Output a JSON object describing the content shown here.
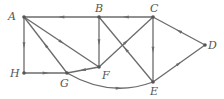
{
  "graph": {
    "type": "directed",
    "nodes": [
      {
        "id": "A",
        "label": "A",
        "x": 24,
        "y": 17,
        "lx": 8,
        "ly": 11
      },
      {
        "id": "B",
        "label": "B",
        "x": 99,
        "y": 17,
        "lx": 95,
        "ly": 3
      },
      {
        "id": "C",
        "label": "C",
        "x": 153,
        "y": 17,
        "lx": 150,
        "ly": 3
      },
      {
        "id": "D",
        "label": "D",
        "x": 205,
        "y": 45,
        "lx": 208,
        "ly": 40
      },
      {
        "id": "E",
        "label": "E",
        "x": 153,
        "y": 82,
        "lx": 150,
        "ly": 86
      },
      {
        "id": "F",
        "label": "F",
        "x": 99,
        "y": 67,
        "lx": 101,
        "ly": 70
      },
      {
        "id": "G",
        "label": "G",
        "x": 67,
        "y": 73,
        "lx": 60,
        "ly": 78
      },
      {
        "id": "H",
        "label": "H",
        "x": 24,
        "y": 73,
        "lx": 10,
        "ly": 68
      }
    ],
    "edges": [
      {
        "from": "B",
        "to": "A"
      },
      {
        "from": "C",
        "to": "B"
      },
      {
        "from": "A",
        "to": "H"
      },
      {
        "from": "H",
        "to": "G"
      },
      {
        "from": "A",
        "to": "F"
      },
      {
        "from": "G",
        "to": "A"
      },
      {
        "from": "B",
        "to": "F"
      },
      {
        "from": "F",
        "to": "G"
      },
      {
        "from": "F",
        "to": "C"
      },
      {
        "from": "E",
        "to": "B"
      },
      {
        "from": "C",
        "to": "E"
      },
      {
        "from": "D",
        "to": "C"
      },
      {
        "from": "E",
        "to": "D"
      },
      {
        "from": "G",
        "to": "E",
        "curved": true
      }
    ]
  },
  "labels": {
    "A": "A",
    "B": "B",
    "C": "C",
    "D": "D",
    "E": "E",
    "F": "F",
    "G": "G",
    "H": "H"
  }
}
